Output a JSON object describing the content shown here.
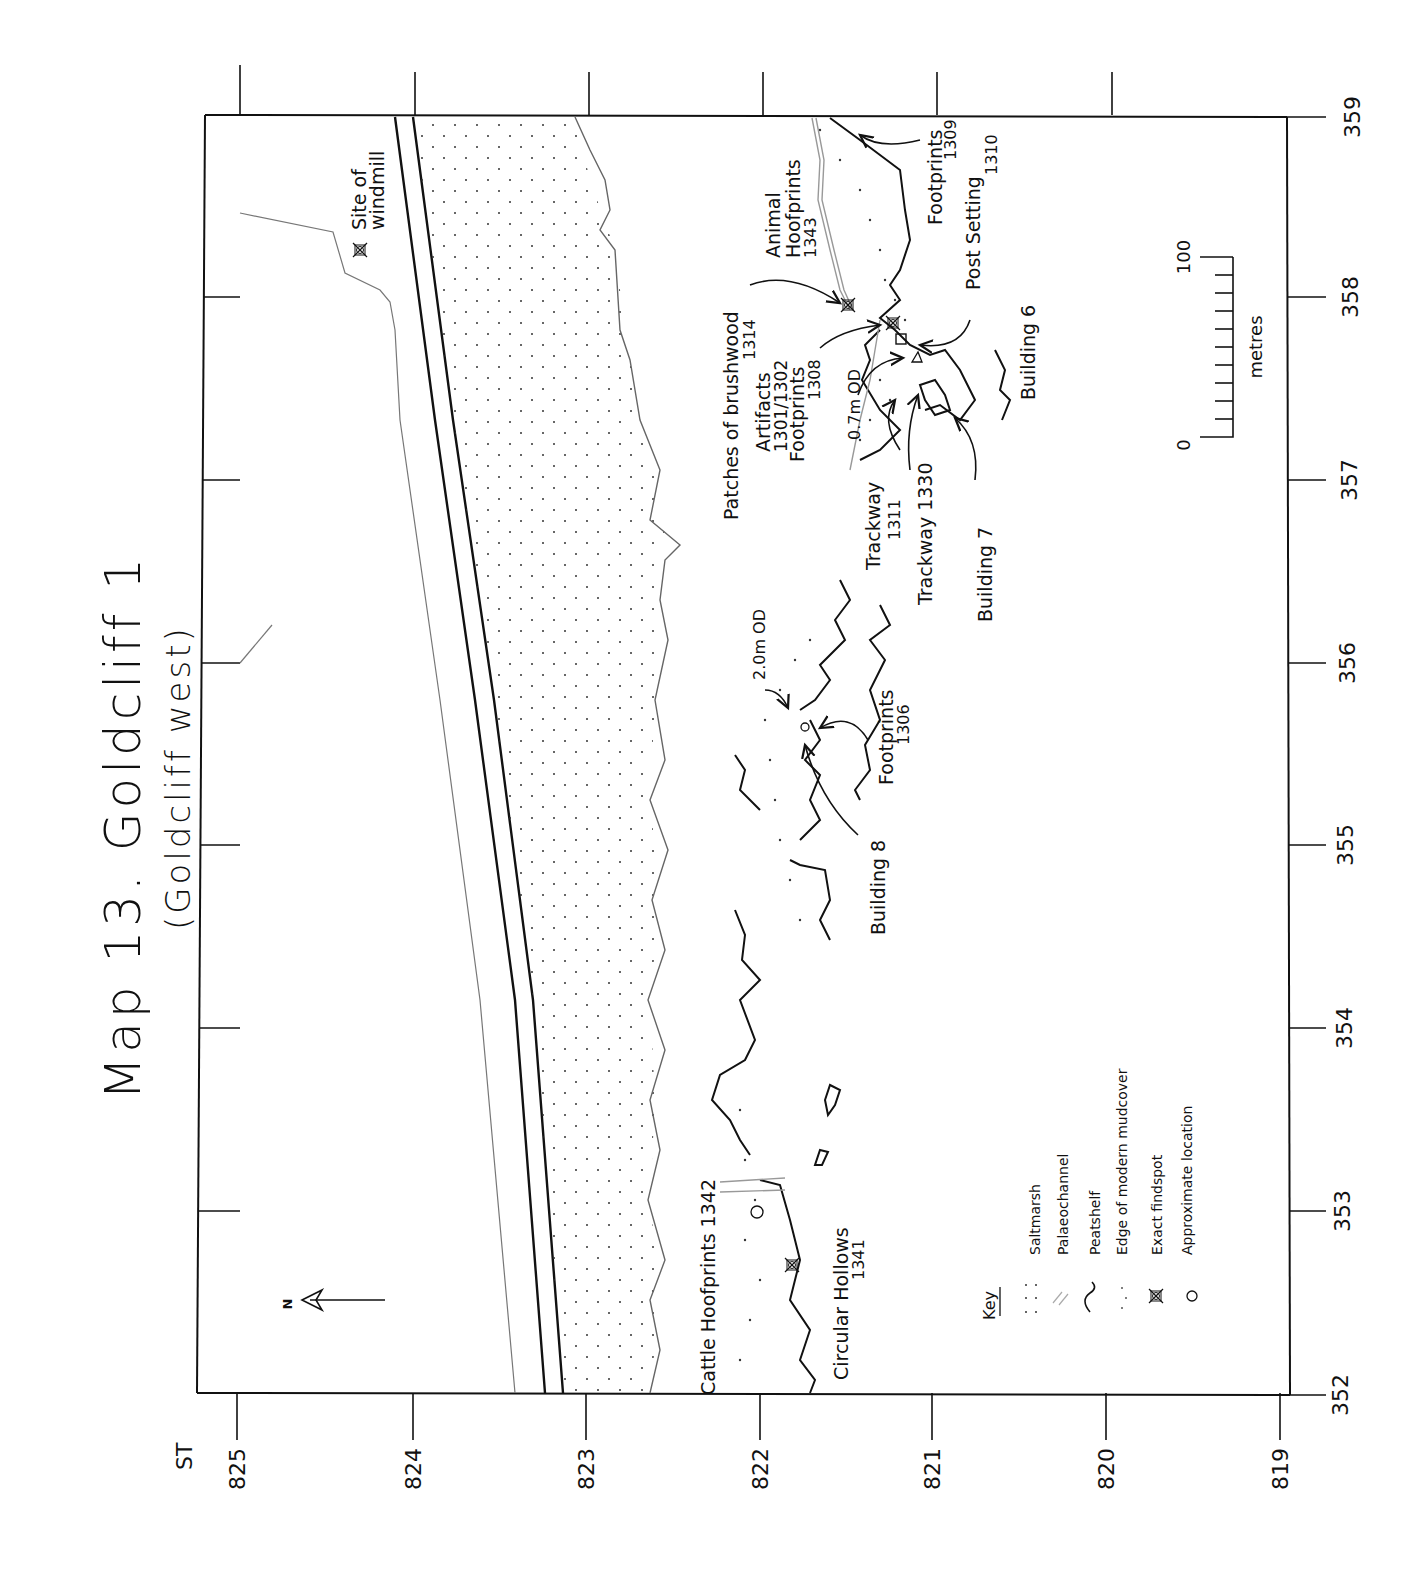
{
  "map": {
    "title": "Map 13.  Goldcliff 1",
    "subtitle": "(Goldcliff west)",
    "grid_prefix": "ST",
    "northings": [
      "825",
      "824",
      "823",
      "822",
      "821",
      "820",
      "819"
    ],
    "eastings": [
      "359",
      "358",
      "357",
      "356",
      "355",
      "354",
      "353",
      "352"
    ],
    "north_label": "N",
    "scale": {
      "start": "0",
      "end": "100",
      "unit": "metres"
    },
    "labels": {
      "windmill_1": "Site of",
      "windmill_2": "windmill",
      "brushwood_1": "Patches of brushwood",
      "brushwood_2": "1314",
      "animal_1": "Animal",
      "animal_2": "Hoofprints",
      "animal_3": "1343",
      "artifacts_1": "Artifacts",
      "artifacts_2": "1301/1302",
      "artifacts_3": "Footprints",
      "artifacts_4": "1308",
      "footprints1309_1": "Footprints",
      "footprints1309_2": "1309",
      "post_1": "Post  Setting",
      "post_2": "1310",
      "building6": "Building  6",
      "od07": "0.7m  OD",
      "trackway1311_1": "Trackway",
      "trackway1311_2": "1311",
      "trackway1330": "Trackway  1330",
      "building7": "Building  7",
      "od20": "2.0m  OD",
      "footprints1306_1": "Footprints",
      "footprints1306_2": "1306",
      "building8": "Building  8",
      "cattle": "Cattle  Hoofprints  1342",
      "circular_1": "Circular  Hollows",
      "circular_2": "1341"
    },
    "key": {
      "title": "Key",
      "items": [
        {
          "symbol": "saltmarsh-dots",
          "label": "Saltmarsh"
        },
        {
          "symbol": "palaeochannel-lines",
          "label": "Palaeochannel"
        },
        {
          "symbol": "peatshelf-wave",
          "label": "Peatshelf"
        },
        {
          "symbol": "mudcover-dotted",
          "label": "Edge  of  modern  mudcover"
        },
        {
          "symbol": "exact-findspot-cross",
          "label": "Exact  findspot"
        },
        {
          "symbol": "approx-circle",
          "label": "Approximate  location"
        }
      ]
    },
    "colors": {
      "ink": "#111111",
      "grey_line": "#8a8a8a",
      "background": "#ffffff"
    }
  }
}
